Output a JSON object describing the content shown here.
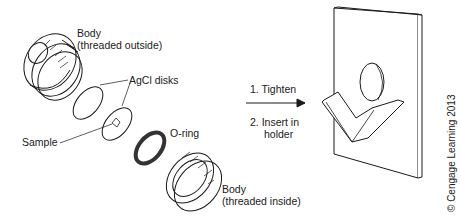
{
  "figure": {
    "labels": {
      "body_outside_line1": "Body",
      "body_outside_line2": "(threaded outside)",
      "agcl_disks": "AgCl disks",
      "sample": "Sample",
      "o_ring": "O-ring",
      "body_inside_line1": "Body",
      "body_inside_line2": "(threaded inside)"
    },
    "steps": {
      "step1": "1.  Tighten",
      "step2_line1": "2.  Insert in",
      "step2_line2": "holder"
    },
    "copyright": "© Cengage Learning 2013",
    "colors": {
      "stroke": "#1a1a1a",
      "fill": "#ffffff",
      "oring": "#555555"
    }
  }
}
